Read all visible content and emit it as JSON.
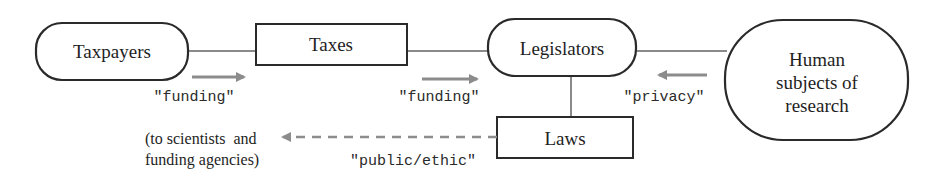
{
  "diagram": {
    "type": "flow",
    "nodes": {
      "taxpayers": {
        "label": "Taxpayers",
        "shape": "rounded"
      },
      "taxes": {
        "label": "Taxes",
        "shape": "rectangle"
      },
      "legislators": {
        "label": "Legislators",
        "shape": "rounded"
      },
      "human_subjects": {
        "lines": [
          "Human",
          "subjects of",
          "research"
        ],
        "shape": "rounded"
      },
      "laws": {
        "label": "Laws",
        "shape": "rectangle"
      }
    },
    "edges": [
      {
        "from": "Taxpayers",
        "to": "Taxes",
        "label": "\"funding\"",
        "direction": "right"
      },
      {
        "from": "Taxes",
        "to": "Legislators",
        "label": "\"funding\"",
        "direction": "right"
      },
      {
        "from": "Human subjects of research",
        "to": "Legislators",
        "label": "\"privacy\"",
        "direction": "left"
      },
      {
        "from": "Legislators",
        "to": "Laws",
        "label": "",
        "direction": "down"
      },
      {
        "from": "Laws",
        "to": "scientists and funding agencies",
        "label": "\"public/ethic\"",
        "direction": "left",
        "style": "dashed"
      }
    ],
    "edge_labels": {
      "funding_1": "\"funding\"",
      "funding_2": "\"funding\"",
      "privacy": "\"privacy\"",
      "public_ethic": "\"public/ethic\""
    },
    "note": {
      "lines": [
        "(to scientists  and",
        "funding agencies)"
      ]
    },
    "colors": {
      "outline": "#2a2a2a",
      "connector": "#8a8a8a",
      "arrow": "#8c8c8c",
      "text": "#1e1e1e"
    }
  }
}
